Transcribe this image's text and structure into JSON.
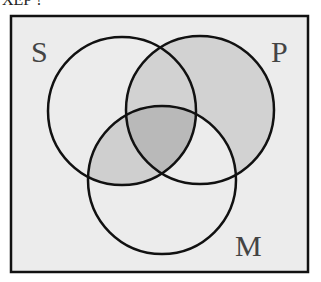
{
  "diagram": {
    "type": "venn",
    "sets": [
      {
        "label": "S",
        "cx": 122,
        "cy": 111,
        "r": 74
      },
      {
        "label": "P",
        "cx": 200,
        "cy": 110,
        "r": 74
      },
      {
        "label": "M",
        "cx": 162,
        "cy": 180,
        "r": 74
      }
    ],
    "labels": {
      "s": "S",
      "p": "P",
      "m": "M"
    },
    "shaded_regions": [
      "S∩P only",
      "P only",
      "S∩M only",
      "S∩P∩M"
    ],
    "colors": {
      "box_bg": "#ececec",
      "shade_light": "#d2d2d2",
      "shade_dark": "#b9b9b9",
      "stroke": "#111111"
    },
    "top_text": "XEP ?"
  }
}
